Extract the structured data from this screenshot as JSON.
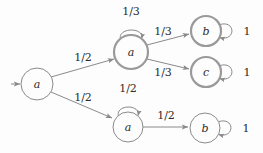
{
  "diagram": {
    "colors": {
      "background": "#fdfdfd",
      "stroke": "#8a8a8a",
      "stroke_bold": "#9a9a9a",
      "text": "#2b2b2b"
    },
    "nodes": [
      {
        "id": "start",
        "label": "a",
        "cx": 37,
        "cy": 84,
        "r": 16,
        "border": "thin"
      },
      {
        "id": "mid_upper_a",
        "label": "a",
        "cx": 131,
        "cy": 52,
        "r": 17,
        "border": "thick"
      },
      {
        "id": "right_b",
        "label": "b",
        "cx": 206,
        "cy": 31,
        "r": 15,
        "border": "thick"
      },
      {
        "id": "right_c",
        "label": "c",
        "cx": 206,
        "cy": 72,
        "r": 15,
        "border": "thick"
      },
      {
        "id": "mid_lower_a",
        "label": "a",
        "cx": 128,
        "cy": 127,
        "r": 15,
        "border": "thin"
      },
      {
        "id": "lower_b",
        "label": "b",
        "cx": 205,
        "cy": 128,
        "r": 15,
        "border": "thin"
      }
    ],
    "edges": [
      {
        "id": "start-in",
        "from": "",
        "to": "start",
        "label": "",
        "label_x": 0,
        "label_y": 0
      },
      {
        "id": "start-to-upper-a",
        "from": "start",
        "to": "mid_upper_a",
        "label": "1/2",
        "label_x": 83,
        "label_y": 57
      },
      {
        "id": "start-to-lower-a",
        "from": "start",
        "to": "mid_lower_a",
        "label": "1/2",
        "label_x": 83,
        "label_y": 97
      },
      {
        "id": "upper-a-to-b",
        "from": "mid_upper_a",
        "to": "right_b",
        "label": "1/3",
        "label_x": 163,
        "label_y": 31
      },
      {
        "id": "upper-a-to-c",
        "from": "mid_upper_a",
        "to": "right_c",
        "label": "1/3",
        "label_x": 163,
        "label_y": 72
      },
      {
        "id": "lower-a-to-b",
        "from": "mid_lower_a",
        "to": "lower_b",
        "label": "1/2",
        "label_x": 166,
        "label_y": 115
      }
    ],
    "self_loops": [
      {
        "id": "loop-upper-a",
        "node": "mid_upper_a",
        "label": "1/3",
        "label_x": 131,
        "label_y": 11,
        "position": "top"
      },
      {
        "id": "loop-lower-a",
        "node": "mid_lower_a",
        "label": "1/2",
        "label_x": 128,
        "label_y": 88,
        "position": "top"
      },
      {
        "id": "loop-right-b",
        "node": "right_b",
        "label": "1",
        "label_x": 247,
        "label_y": 31,
        "position": "right"
      },
      {
        "id": "loop-right-c",
        "node": "right_c",
        "label": "1",
        "label_x": 247,
        "label_y": 72,
        "position": "right"
      },
      {
        "id": "loop-lower-b",
        "node": "lower_b",
        "label": "1",
        "label_x": 246,
        "label_y": 128,
        "position": "right"
      }
    ]
  }
}
